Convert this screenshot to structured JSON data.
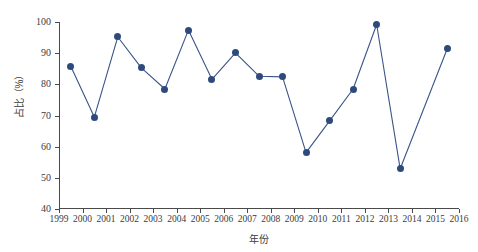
{
  "chart_data": {
    "type": "line",
    "title": "",
    "xlabel": "年份",
    "ylabel": "占比（%）",
    "xlim": [
      1999,
      2016
    ],
    "ylim": [
      40,
      100
    ],
    "grid": false,
    "legend": false,
    "marker_color": "#2e4a7d",
    "line_color": "#3a5488",
    "x_tick_labels": [
      "1999",
      "2000",
      "2001",
      "2002",
      "2003",
      "2004",
      "2005",
      "2006",
      "2007",
      "2008",
      "2009",
      "2010",
      "2011",
      "2012",
      "2013",
      "2014",
      "2015",
      "2016"
    ],
    "y_tick_labels": [
      "40",
      "50",
      "60",
      "70",
      "80",
      "90",
      "100"
    ],
    "categories": [
      "1999",
      "2000",
      "2001",
      "2002",
      "2003",
      "2004",
      "2005",
      "2006",
      "2007",
      "2008",
      "2009",
      "2010",
      "2011",
      "2012",
      "2013",
      "2015"
    ],
    "x": [
      1999.5,
      2000.5,
      2001.5,
      2002.5,
      2003.5,
      2004.5,
      2005.5,
      2006.5,
      2007.5,
      2008.5,
      2009.5,
      2010.5,
      2011.5,
      2012.5,
      2013.5,
      2015.5
    ],
    "values": [
      85.8,
      69.5,
      95.2,
      85.3,
      78.5,
      97.4,
      81.6,
      90.1,
      82.6,
      82.4,
      58.1,
      68.3,
      78.5,
      99.2,
      52.9,
      91.4
    ]
  }
}
